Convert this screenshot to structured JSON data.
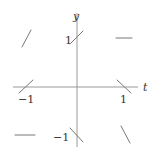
{
  "diagram": {
    "type": "slope-field",
    "axes": {
      "x_label": "t",
      "y_label": "y",
      "x_ticks": [
        {
          "value": -1,
          "label": "−1"
        },
        {
          "value": 1,
          "label": "1"
        }
      ],
      "y_ticks": [
        {
          "value": 1,
          "label": "1"
        },
        {
          "value": -1,
          "label": "−1"
        }
      ]
    },
    "segments": [
      {
        "t": -1,
        "y": 1,
        "slope": 2
      },
      {
        "t": 0,
        "y": 1,
        "slope": 1
      },
      {
        "t": 1,
        "y": 1,
        "slope": 0
      },
      {
        "t": -1,
        "y": 0,
        "slope": 1
      },
      {
        "t": 1,
        "y": 0,
        "slope": -1
      },
      {
        "t": -1,
        "y": -1,
        "slope": 0
      },
      {
        "t": 0,
        "y": -1,
        "slope": -1
      },
      {
        "t": 1,
        "y": -1,
        "slope": -2
      }
    ],
    "colors": {
      "axis": "#9a9a9a",
      "segment": "#777777",
      "text": "#333333"
    }
  }
}
